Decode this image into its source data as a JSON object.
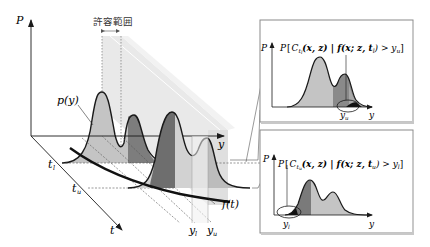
{
  "diagram": {
    "main": {
      "axis_p_label": "P",
      "axis_y_label": "y",
      "axis_t_label": "t",
      "tolerance_label": "許容範囲",
      "density_label": "p(y)",
      "curve_label": "f(t)",
      "t_lower_label": "t",
      "t_lower_sub": "l",
      "t_upper_label": "t",
      "t_upper_sub": "u",
      "y_lower_label": "y",
      "y_lower_sub": "l",
      "y_upper_label": "y",
      "y_upper_sub": "u"
    },
    "inset_top": {
      "axis_p_label": "P",
      "axis_y_label": "y",
      "formula": "P[C_{t_l}(x, z) | f(x; z, t_l) > y_u]",
      "formula_parts": {
        "p": "P",
        "open": "[",
        "c": "C",
        "c_sub": "t",
        "c_subsub": "l",
        "args": "(x, z) | f(x; z, t",
        "t_sub": "l",
        "cond": ") > y",
        "y_sub": "u",
        "close": "]"
      },
      "marker_label": "y",
      "marker_sub": "u"
    },
    "inset_bottom": {
      "axis_p_label": "P",
      "axis_y_label": "y",
      "formula": "P[C_{t_u}(x, z) | f(x; z, t_u) > y_l]",
      "formula_parts": {
        "p": "P",
        "open": "[",
        "c": "C",
        "c_sub": "t",
        "c_subsub": "u",
        "args": "(x, z) | f(x; z, t",
        "t_sub": "u",
        "cond": ") > y",
        "y_sub": "l",
        "close": "]"
      },
      "marker_label": "y",
      "marker_sub": "l"
    },
    "colors": {
      "line": "#1a1a1a",
      "fill_light": "#c8c8c8",
      "fill_mid": "#9a9a9a",
      "fill_dark": "#5e5e5e",
      "band": "#e4e4e4",
      "band_light": "#efefef",
      "frame": "#8a8a8a"
    }
  }
}
